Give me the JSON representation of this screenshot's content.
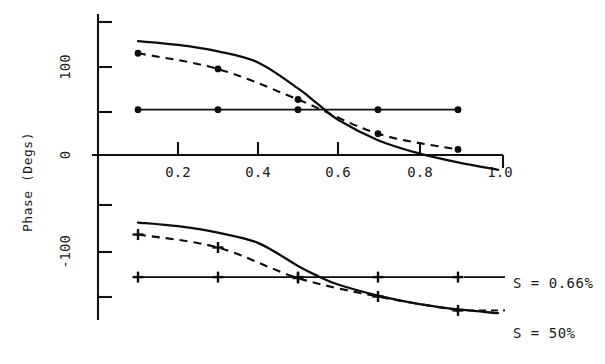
{
  "chart_data": {
    "type": "line",
    "title": "",
    "xlabel": "",
    "ylabel": "Phase (Degs)",
    "xlim": [
      0.0,
      1.0
    ],
    "ylim": [
      -170,
      160
    ],
    "grid": false,
    "legend_position": "right",
    "x_ticks": [
      0.2,
      0.4,
      0.6,
      0.8,
      1.0
    ],
    "x_tick_labels": [
      "0.2",
      "0.4",
      "0.6",
      "0.8",
      "1.0"
    ],
    "y_ticks": [
      150,
      100,
      50,
      0,
      -50,
      -100,
      -150
    ],
    "y_tick_labels": [
      "",
      "100",
      "",
      "0",
      "",
      "-100",
      ""
    ],
    "annotations": [
      {
        "text": "S = 0.66%",
        "x": 1.04,
        "y": -122
      },
      {
        "text": "S = 50%",
        "x": 1.04,
        "y": -162
      }
    ],
    "series": [
      {
        "name": "S = 0.66% theory (upper)",
        "style": "solid",
        "marker": "none",
        "group": "upper",
        "x": [
          0.1,
          0.2,
          0.3,
          0.4,
          0.5,
          0.55,
          0.6,
          0.7,
          0.8,
          0.9,
          1.0
        ],
        "y": [
          123,
          119,
          112,
          100,
          72,
          55,
          38,
          16,
          2,
          -8,
          -16
        ]
      },
      {
        "name": "S = 0.66% measured (upper)",
        "style": "dashed",
        "marker": "circle",
        "group": "upper",
        "x": [
          0.1,
          0.3,
          0.5,
          0.7,
          0.9
        ],
        "y": [
          110,
          93,
          60,
          23,
          6
        ]
      },
      {
        "name": "S = 50% (upper flat)",
        "style": "solid-flat",
        "marker": "circle",
        "group": "upper",
        "x": [
          0.1,
          0.3,
          0.5,
          0.7,
          0.9
        ],
        "y": [
          49,
          49,
          49,
          49,
          49
        ]
      },
      {
        "name": "S = 0.66% theory (lower)",
        "style": "solid",
        "marker": "none",
        "group": "lower",
        "x": [
          0.1,
          0.2,
          0.3,
          0.4,
          0.5,
          0.55,
          0.6,
          0.7,
          0.8,
          0.9,
          1.0
        ],
        "y": [
          -73,
          -77,
          -84,
          -95,
          -120,
          -131,
          -140,
          -152,
          -161,
          -167,
          -171
        ]
      },
      {
        "name": "S = 0.66% measured (lower)",
        "style": "dashed",
        "marker": "plus",
        "group": "lower",
        "x": [
          0.1,
          0.3,
          0.5,
          0.7,
          0.9
        ],
        "y": [
          -86,
          -100,
          -133,
          -153,
          -168
        ]
      },
      {
        "name": "S = 50% (lower flat)",
        "style": "solid-flat",
        "marker": "plus",
        "group": "lower",
        "x": [
          0.1,
          0.3,
          0.5,
          0.7,
          0.9
        ],
        "y": [
          -132,
          -132,
          -132,
          -132,
          -132
        ]
      }
    ]
  },
  "axes": {
    "y_title": "Phase (Degs)",
    "tick_100": "100",
    "tick_0": "0",
    "tick_neg100": "-100",
    "tick_x_02": "0.2",
    "tick_x_04": "0.4",
    "tick_x_06": "0.6",
    "tick_x_08": "0.8",
    "tick_x_10": "1.0"
  },
  "legend": {
    "entry_1": "S = 0.66%",
    "entry_2": "S = 50%"
  },
  "colors": {
    "ink": "#0d0d0d",
    "background": "#ffffff"
  }
}
